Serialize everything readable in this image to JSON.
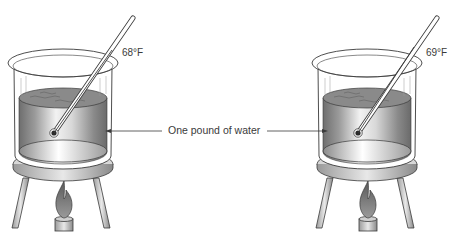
{
  "figure": {
    "center_label": "One pound of water",
    "beakers": [
      {
        "id": "left",
        "temperature_label": "68°F"
      },
      {
        "id": "right",
        "temperature_label": "69°F"
      }
    ],
    "colors": {
      "outline": "#3a3a3a",
      "water_dark": "#7a7a7a",
      "water_light": "#e6e6e6",
      "glass": "#ffffff"
    }
  }
}
